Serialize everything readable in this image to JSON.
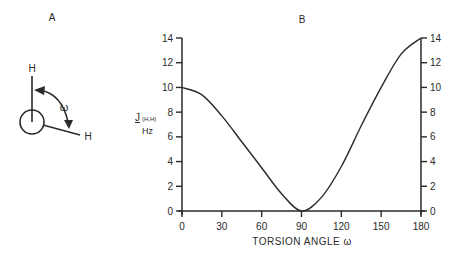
{
  "panels": {
    "a": {
      "label": "A",
      "atom_top": "H",
      "atom_right": "H",
      "angle_symbol": "ω"
    },
    "b": {
      "label": "B"
    }
  },
  "colors": {
    "ink": "#2a2a2a",
    "background": "#ffffff"
  },
  "chart_data": {
    "type": "line",
    "title": "B",
    "xlabel": "TORSION ANGLE ω",
    "ylabel": "J(H,H) Hz",
    "ylabel_main": "J",
    "ylabel_sub": "(H,H)",
    "ylabel_unit": "Hz",
    "xlim": [
      0,
      180
    ],
    "ylim": [
      0,
      14
    ],
    "x_ticks": [
      0,
      30,
      60,
      90,
      120,
      150,
      180
    ],
    "y_ticks": [
      0,
      2,
      4,
      6,
      8,
      10,
      12,
      14
    ],
    "y_axis_right": true,
    "grid": false,
    "legend": null,
    "series": [
      {
        "name": "Karplus curve",
        "x": [
          0,
          15,
          30,
          45,
          60,
          75,
          90,
          105,
          120,
          135,
          150,
          165,
          180
        ],
        "values": [
          10.0,
          9.4,
          7.7,
          5.6,
          3.5,
          1.4,
          0.0,
          1.1,
          3.6,
          6.9,
          10.0,
          12.7,
          14.0
        ]
      }
    ]
  }
}
